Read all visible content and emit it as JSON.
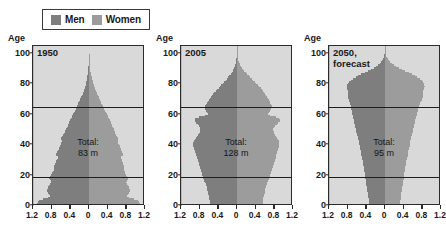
{
  "legend": {
    "items": [
      {
        "label": "Men",
        "color": "#7e7e7e",
        "icon": "square-swatch-icon"
      },
      {
        "label": "Women",
        "color": "#9c9c9c",
        "icon": "square-swatch-icon"
      }
    ]
  },
  "axis": {
    "y_label": "Age",
    "y_ticks": [
      "0",
      "20",
      "40",
      "60",
      "80",
      "100"
    ],
    "x_ticks": [
      "1.2",
      "0.8",
      "0.4",
      "0",
      "0.4",
      "0.8",
      "1.2"
    ]
  },
  "chart_data": {
    "type": "bar",
    "subtype": "population-pyramid",
    "title": "",
    "xlabel": "",
    "ylabel": "Age",
    "xlim": [
      -1.2,
      1.2
    ],
    "ylim": [
      0,
      105
    ],
    "grid": false,
    "legend_position": "top",
    "units": "millions per age year",
    "reference_lines": [
      19,
      65
    ],
    "panels": [
      {
        "title": "1950",
        "total_label": "Total:\n83 m",
        "total_value": 83,
        "ages": [
          0,
          2,
          4,
          6,
          8,
          10,
          12,
          14,
          16,
          18,
          20,
          22,
          24,
          26,
          28,
          30,
          32,
          34,
          36,
          38,
          40,
          42,
          44,
          46,
          48,
          50,
          52,
          54,
          56,
          58,
          60,
          62,
          64,
          66,
          68,
          70,
          72,
          74,
          76,
          78,
          80,
          82,
          84,
          86,
          88,
          90,
          92,
          94,
          96,
          98,
          100
        ],
        "series": [
          {
            "name": "Men",
            "values": [
              1.08,
              1.12,
              1.05,
              0.82,
              0.86,
              0.9,
              0.88,
              0.84,
              0.8,
              0.86,
              0.82,
              0.78,
              0.74,
              0.76,
              0.72,
              0.7,
              0.66,
              0.72,
              0.68,
              0.64,
              0.62,
              0.58,
              0.6,
              0.56,
              0.52,
              0.5,
              0.46,
              0.44,
              0.42,
              0.38,
              0.35,
              0.31,
              0.28,
              0.25,
              0.22,
              0.19,
              0.16,
              0.13,
              0.11,
              0.09,
              0.07,
              0.05,
              0.04,
              0.03,
              0.02,
              0.015,
              0.01,
              0.006,
              0.004,
              0.002,
              0.001
            ]
          },
          {
            "name": "Women",
            "values": [
              1.05,
              1.1,
              1.02,
              0.8,
              0.84,
              0.88,
              0.86,
              0.83,
              0.79,
              0.85,
              0.81,
              0.77,
              0.74,
              0.76,
              0.73,
              0.71,
              0.68,
              0.74,
              0.7,
              0.67,
              0.65,
              0.61,
              0.63,
              0.59,
              0.56,
              0.54,
              0.5,
              0.48,
              0.46,
              0.42,
              0.39,
              0.35,
              0.32,
              0.29,
              0.26,
              0.23,
              0.2,
              0.17,
              0.14,
              0.12,
              0.1,
              0.08,
              0.06,
              0.045,
              0.03,
              0.022,
              0.015,
              0.009,
              0.005,
              0.003,
              0.0015
            ]
          }
        ]
      },
      {
        "title": "2005",
        "total_label": "Total:\n128 m",
        "total_value": 128,
        "ages": [
          0,
          2,
          4,
          6,
          8,
          10,
          12,
          14,
          16,
          18,
          20,
          22,
          24,
          26,
          28,
          30,
          32,
          34,
          36,
          38,
          40,
          42,
          44,
          46,
          48,
          50,
          52,
          54,
          56,
          58,
          60,
          62,
          64,
          66,
          68,
          70,
          72,
          74,
          76,
          78,
          80,
          82,
          84,
          86,
          88,
          90,
          92,
          94,
          96,
          98,
          100
        ],
        "series": [
          {
            "name": "Men",
            "values": [
              0.57,
              0.58,
              0.59,
              0.6,
              0.62,
              0.63,
              0.64,
              0.66,
              0.69,
              0.72,
              0.74,
              0.76,
              0.78,
              0.8,
              0.82,
              0.84,
              0.86,
              0.88,
              0.9,
              0.92,
              0.94,
              0.93,
              0.88,
              0.84,
              0.8,
              0.78,
              0.8,
              0.86,
              0.92,
              0.88,
              0.62,
              0.66,
              0.7,
              0.68,
              0.64,
              0.6,
              0.55,
              0.5,
              0.44,
              0.38,
              0.32,
              0.26,
              0.2,
              0.15,
              0.1,
              0.07,
              0.045,
              0.026,
              0.014,
              0.006,
              0.002
            ]
          },
          {
            "name": "Women",
            "values": [
              0.54,
              0.55,
              0.56,
              0.57,
              0.59,
              0.6,
              0.61,
              0.63,
              0.66,
              0.69,
              0.71,
              0.73,
              0.75,
              0.77,
              0.79,
              0.81,
              0.83,
              0.85,
              0.87,
              0.89,
              0.91,
              0.9,
              0.86,
              0.82,
              0.79,
              0.77,
              0.8,
              0.87,
              0.93,
              0.9,
              0.65,
              0.7,
              0.75,
              0.74,
              0.71,
              0.68,
              0.64,
              0.6,
              0.55,
              0.49,
              0.43,
              0.37,
              0.3,
              0.23,
              0.17,
              0.12,
              0.08,
              0.048,
              0.026,
              0.012,
              0.004
            ]
          }
        ]
      },
      {
        "title": "2050,\nforecast",
        "total_label": "Total:\n95 m",
        "total_value": 95,
        "ages": [
          0,
          2,
          4,
          6,
          8,
          10,
          12,
          14,
          16,
          18,
          20,
          22,
          24,
          26,
          28,
          30,
          32,
          34,
          36,
          38,
          40,
          42,
          44,
          46,
          48,
          50,
          52,
          54,
          56,
          58,
          60,
          62,
          64,
          66,
          68,
          70,
          72,
          74,
          76,
          78,
          80,
          82,
          84,
          86,
          88,
          90,
          92,
          94,
          96,
          98,
          100
        ],
        "series": [
          {
            "name": "Men",
            "values": [
              0.33,
              0.34,
              0.35,
              0.36,
              0.37,
              0.38,
              0.39,
              0.4,
              0.41,
              0.42,
              0.43,
              0.44,
              0.45,
              0.46,
              0.47,
              0.48,
              0.5,
              0.51,
              0.52,
              0.53,
              0.55,
              0.56,
              0.58,
              0.59,
              0.61,
              0.62,
              0.64,
              0.65,
              0.67,
              0.68,
              0.7,
              0.71,
              0.73,
              0.74,
              0.76,
              0.78,
              0.8,
              0.78,
              0.8,
              0.82,
              0.8,
              0.76,
              0.66,
              0.54,
              0.4,
              0.27,
              0.17,
              0.1,
              0.05,
              0.02,
              0.008
            ]
          },
          {
            "name": "Women",
            "values": [
              0.31,
              0.32,
              0.33,
              0.34,
              0.35,
              0.36,
              0.37,
              0.38,
              0.39,
              0.4,
              0.41,
              0.42,
              0.43,
              0.44,
              0.45,
              0.46,
              0.48,
              0.49,
              0.5,
              0.51,
              0.53,
              0.54,
              0.56,
              0.57,
              0.59,
              0.6,
              0.62,
              0.63,
              0.65,
              0.66,
              0.68,
              0.7,
              0.72,
              0.74,
              0.76,
              0.79,
              0.82,
              0.8,
              0.83,
              0.85,
              0.84,
              0.81,
              0.72,
              0.61,
              0.47,
              0.33,
              0.21,
              0.13,
              0.07,
              0.03,
              0.012
            ]
          }
        ]
      }
    ]
  }
}
